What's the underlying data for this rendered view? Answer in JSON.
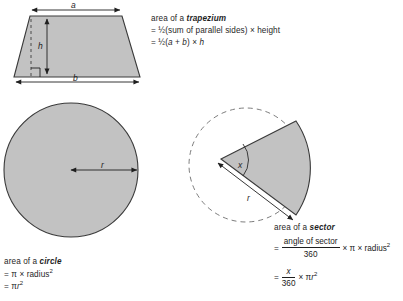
{
  "page": {
    "background": "#ffffff",
    "shape_fill": "#c2c2c2",
    "shape_stroke": "#3a3a3a",
    "ink": "#1f1f1f"
  },
  "trapezium": {
    "labels": {
      "top_side": "a",
      "bottom_side": "b",
      "height": "h"
    },
    "caption": {
      "title_prefix": "area of a ",
      "title_name": "trapezium",
      "line1": "= ½(sum of parallel sides) × height",
      "line2_pre": "= ½(",
      "line2_a": "a",
      "line2_plus": " + ",
      "line2_b": "b",
      "line2_mid": ") × ",
      "line2_h": "h"
    }
  },
  "circle": {
    "labels": {
      "radius": "r"
    },
    "caption": {
      "title_prefix": "area of a ",
      "title_name": "circle",
      "line1_pre": "= π × radius",
      "line1_sup": "2",
      "line2_pre": "= π",
      "line2_r": "r",
      "line2_sup": "2"
    }
  },
  "sector": {
    "labels": {
      "angle": "x",
      "radius": "r"
    },
    "caption": {
      "title_prefix": "area of a ",
      "title_name": "sector",
      "eq1_sign": "=",
      "eq1_num": "angle of sector",
      "eq1_den": "360",
      "eq1_rest_pre": "× π × radius",
      "eq1_rest_sup": "2",
      "eq2_sign": "=",
      "eq2_num": "x",
      "eq2_den": "360",
      "eq2_rest_pre": "× π",
      "eq2_rest_r": "r",
      "eq2_rest_sup": "2"
    }
  }
}
